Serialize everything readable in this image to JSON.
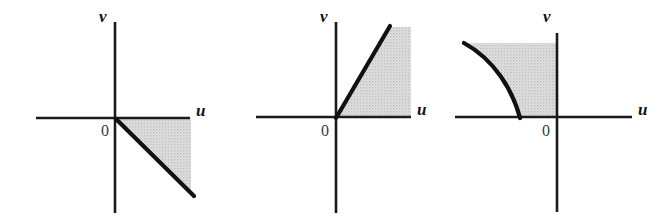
{
  "document": {
    "type": "mathematical-figure-strip",
    "description": "Three coordinate-plane sketches in the uv-plane, each showing a shaded image region bounded by a heavy curve through the origin.",
    "background_color": "#ffffff",
    "ink_color": "#111111",
    "shade_color": "#d4d4d4",
    "shade_pattern": "dithered-gray-stipple"
  },
  "figures": [
    {
      "id": "figure-1",
      "name": "half-plane-below-descending-line",
      "axes": {
        "horizontal_label": "u",
        "vertical_label": "v",
        "origin_label": "0"
      },
      "boundary": {
        "kind": "line",
        "slope": -1,
        "from": [
          0,
          0
        ],
        "to": [
          75,
          -75
        ],
        "description": "straight line of slope -1 descending from the origin into the fourth quadrant"
      },
      "shaded_region": {
        "description": "wedge in the fourth quadrant between the positive u-axis and the descending line v = -u",
        "vertices": [
          [
            0,
            0
          ],
          [
            75,
            0
          ],
          [
            75,
            -75
          ]
        ]
      }
    },
    {
      "id": "figure-2",
      "name": "wedge-above-ascending-line",
      "axes": {
        "horizontal_label": "u",
        "vertical_label": "v",
        "origin_label": "0"
      },
      "boundary": {
        "kind": "line",
        "slope": 1.73,
        "from": [
          0,
          0
        ],
        "to": [
          52,
          90
        ],
        "description": "straight line of steep positive slope rising from the origin into the first quadrant"
      },
      "shaded_region": {
        "description": "wedge in the first quadrant between the positive u-axis and the steep ascending line",
        "vertices": [
          [
            0,
            0
          ],
          [
            75,
            0
          ],
          [
            75,
            90
          ],
          [
            52,
            90
          ]
        ]
      }
    },
    {
      "id": "figure-3",
      "name": "region-left-of-concave-curve",
      "axes": {
        "horizontal_label": "u",
        "vertical_label": "v",
        "origin_label": "0"
      },
      "boundary": {
        "kind": "curve",
        "shape": "concave-left-arc",
        "from": [
          -38,
          0
        ],
        "to": [
          -93,
          76
        ],
        "description": "heavy concave arc starting on the negative u-axis and sweeping up and to the left"
      },
      "shaded_region": {
        "description": "region in the second quadrant bounded left by the arc, right by the v-axis, below by the negative u-axis and above by the top of the arc",
        "vertices": [
          [
            -38,
            0
          ],
          [
            0,
            0
          ],
          [
            0,
            76
          ],
          [
            -93,
            76
          ]
        ]
      }
    }
  ]
}
